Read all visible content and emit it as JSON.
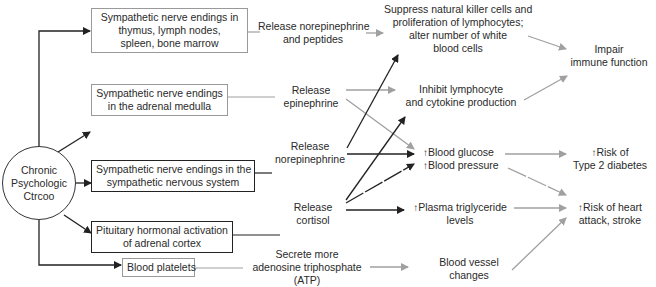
{
  "source": {
    "label_lines": [
      "Chronic",
      "Psychologic",
      "Ctrcoo"
    ]
  },
  "pathways": [
    {
      "box": [
        "Sympathetic nerve endings in",
        "thymus, lymph nodes,",
        "spleen, bone marrow"
      ],
      "action": [
        "Release norepinephrine",
        "and peptides"
      ]
    },
    {
      "box": [
        "Sympathetic nerve endings",
        "in the adrenal medulla"
      ],
      "action": [
        "Release",
        "epinephrine"
      ]
    },
    {
      "box": [
        "Sympathetic nerve endings in the",
        "sympathetic nervous system"
      ],
      "action": [
        "Release",
        "norepinephrine"
      ]
    },
    {
      "box": [
        "Pituitary hormonal activation",
        "of adrenal cortex"
      ],
      "action": [
        "Release",
        "cortisol"
      ]
    },
    {
      "box": [
        "Blood platelets"
      ],
      "action": [
        "Secrete more",
        "adenosine triphosphate",
        "(ATP)"
      ]
    }
  ],
  "effects": {
    "suppress": [
      "Suppress natural killer cells and",
      "proliferation of lymphocytes;",
      "alter number of white",
      "blood cells"
    ],
    "inhibit": [
      "Inhibit lymphocyte",
      "and cytokine production"
    ],
    "glucose": "Blood glucose",
    "pressure": "Blood pressure",
    "triglyceride": [
      "Plasma triglyceride",
      "levels"
    ],
    "vessel": [
      "Blood vessel",
      "changes"
    ]
  },
  "outcomes": {
    "immune": [
      "Impair",
      "immune function"
    ],
    "diabetes": [
      "Risk of",
      "Type 2 diabetes"
    ],
    "heart": [
      "Risk of heart",
      "attack, stroke"
    ]
  },
  "symbols": {
    "increase": "🠅"
  },
  "colors": {
    "dark_line": "#222222",
    "light_line": "#a0a0a0"
  }
}
